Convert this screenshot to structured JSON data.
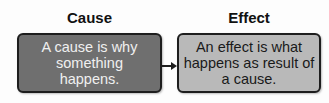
{
  "cause": {
    "title": "Cause",
    "text": "A cause is why something happens."
  },
  "effect": {
    "title": "Effect",
    "text": "An effect is what happens as result of a cause."
  },
  "colors": {
    "cause_fill": "#6f6f6f",
    "effect_fill": "#b9b9b9",
    "border": "#1e1e1e"
  }
}
